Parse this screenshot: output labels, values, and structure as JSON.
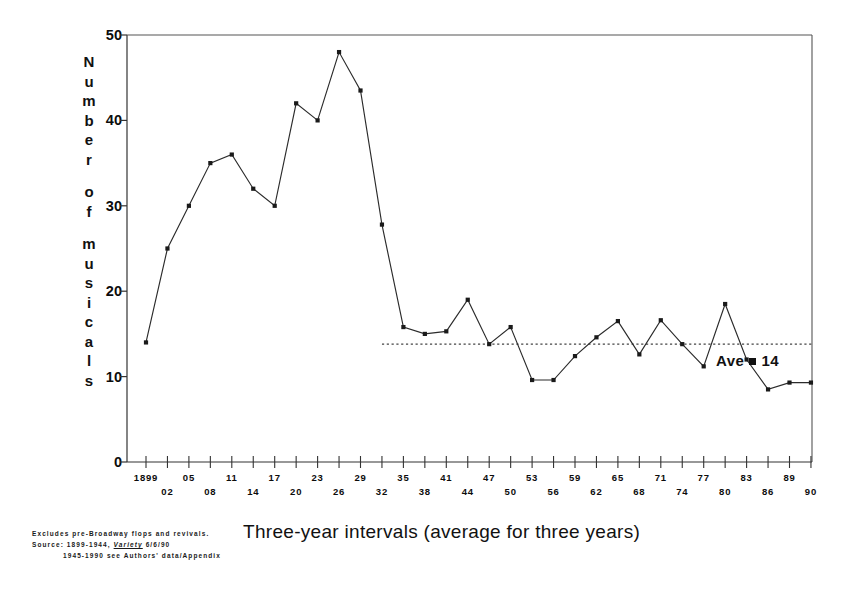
{
  "chart_data": {
    "type": "line",
    "title": "",
    "xlabel": "Three-year intervals (average for three years)",
    "ylabel": "Number of musicals",
    "ylim": [
      0,
      50
    ],
    "yticks": [
      0,
      10,
      20,
      30,
      40,
      50
    ],
    "grid": false,
    "legend": null,
    "annotations": [
      {
        "text": "Ave",
        "symbol": "=",
        "value": "14",
        "kind": "average-reference-line",
        "y": 13.8
      }
    ],
    "reference_line": {
      "label": "Ave = 14",
      "value": 13.8,
      "style": "dotted",
      "x_start_category": "32",
      "x_end_category": "90"
    },
    "categories": [
      "1899",
      "02",
      "05",
      "08",
      "11",
      "14",
      "17",
      "20",
      "23",
      "26",
      "29",
      "32",
      "35",
      "38",
      "41",
      "44",
      "47",
      "50",
      "53",
      "56",
      "59",
      "62",
      "65",
      "68",
      "71",
      "74",
      "77",
      "80",
      "83",
      "86",
      "89",
      "90"
    ],
    "values": [
      14,
      25,
      30,
      35,
      36,
      32,
      30,
      42,
      40,
      48,
      43.5,
      27.8,
      15.8,
      15.0,
      15.3,
      19.0,
      13.8,
      15.8,
      9.6,
      9.6,
      12.4,
      14.6,
      16.5,
      12.6,
      16.6,
      13.8,
      11.2,
      18.5,
      12.0,
      8.5,
      9.3,
      9.3
    ],
    "marker": "square",
    "line_color": "#2b2b2b",
    "marker_color": "#1a1a1a"
  },
  "axes": {
    "y_title_letters": [
      "N",
      "u",
      "m",
      "b",
      "e",
      "r",
      "",
      "o",
      "f",
      "",
      "m",
      "u",
      "s",
      "i",
      "c",
      "a",
      "l",
      "s"
    ],
    "y_tick_labels": [
      "50",
      "40",
      "30",
      "20",
      "10",
      "0"
    ],
    "x_tick_labels_row_top": [
      "1899",
      "05",
      "11",
      "17",
      "23",
      "29",
      "35",
      "41",
      "47",
      "53",
      "59",
      "65",
      "71",
      "77",
      "83",
      "89"
    ],
    "x_tick_labels_row_bottom": [
      "02",
      "08",
      "14",
      "20",
      "26",
      "32",
      "38",
      "44",
      "50",
      "56",
      "62",
      "68",
      "74",
      "80",
      "86",
      "90"
    ]
  },
  "annotation": {
    "ave_label": "Ave",
    "ave_value": "14"
  },
  "xaxis_title": "Three-year intervals (average for three years)",
  "footnotes": {
    "line1": "Excludes pre-Broadway flops and revivals.",
    "line2_prefix": "Source: 1899-1944,",
    "line2_source": "Variety",
    "line2_suffix": "6/6/90",
    "line3": "1945-1990 see Authors' data/Appendix"
  }
}
